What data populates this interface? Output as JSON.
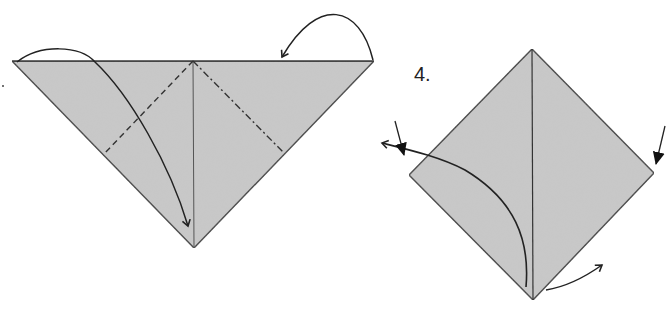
{
  "diagram": {
    "type": "origami-instructions",
    "colors": {
      "paper": "#c9c9c9",
      "edge": "#3a3a3a",
      "arrow": "#222222",
      "background": "#ffffff"
    },
    "step3": {
      "label": "",
      "shape": "triangle",
      "vertices": {
        "top_left": [
          12,
          61
        ],
        "top_right": [
          374,
          61
        ],
        "bottom": [
          194,
          248
        ]
      },
      "center_crease": {
        "from": [
          193,
          61
        ],
        "to": [
          194,
          248
        ],
        "style": "solid"
      },
      "valley_fold": {
        "from": [
          193,
          61
        ],
        "to": [
          103,
          155
        ],
        "style": "dashed"
      },
      "mountain_fold": {
        "from": [
          193,
          61
        ],
        "to": [
          283,
          152
        ],
        "style": "dash-dot"
      },
      "arrows": [
        {
          "name": "fold-left-corner-down",
          "kind": "valley-fold-arrow"
        },
        {
          "name": "fold-right-corner-behind",
          "kind": "mountain-fold-arrow"
        }
      ]
    },
    "step4": {
      "label": "4.",
      "shape": "diamond",
      "vertices": {
        "top": [
          532,
          49
        ],
        "left": [
          409,
          175
        ],
        "right": [
          654,
          173
        ],
        "bottom": [
          533,
          300
        ]
      },
      "center_crease": {
        "from": [
          532,
          49
        ],
        "to": [
          533,
          300
        ],
        "style": "solid"
      },
      "arrows": [
        {
          "name": "unfold-left-flap",
          "kind": "open-arrow"
        },
        {
          "name": "push-left-corner",
          "kind": "push-arrow"
        },
        {
          "name": "push-right-corner",
          "kind": "push-arrow"
        },
        {
          "name": "turn-bottom-right",
          "kind": "open-arrow"
        }
      ]
    }
  }
}
